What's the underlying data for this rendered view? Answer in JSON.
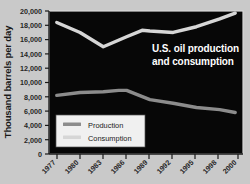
{
  "chart_data": {
    "type": "line",
    "title": "U.S. oil production and consumption",
    "title_line1": "U.S. oil production",
    "title_line2": "and consumption",
    "xlabel": "",
    "ylabel": "Thousand barrels per day",
    "x": [
      1977,
      1980,
      1983,
      1986,
      1989,
      1992,
      1995,
      1998,
      2000
    ],
    "categories": [
      "1977",
      "1980",
      "1983",
      "1986",
      "1989",
      "1992",
      "1995",
      "1998",
      "2000"
    ],
    "xlim": [
      1976,
      2001
    ],
    "ylim": [
      0,
      20000
    ],
    "yticks": [
      0,
      2000,
      4000,
      6000,
      8000,
      10000,
      12000,
      14000,
      16000,
      18000,
      20000
    ],
    "ytick_labels": [
      "0",
      "2,000",
      "4,000",
      "6,000",
      "8,000",
      "10,000",
      "12,000",
      "14,000",
      "16,000",
      "18,000",
      "20,000"
    ],
    "grid": false,
    "legend_position": "lower-left",
    "plot_background": "#050505",
    "figure_background": "#c9c9c9",
    "series": [
      {
        "name": "Production",
        "color": "#8c8c8c",
        "values": [
          8200,
          8600,
          8700,
          8900,
          7600,
          7100,
          6500,
          6200,
          5800
        ],
        "points": [
          {
            "x": 1977,
            "y": 8200
          },
          {
            "x": 1980,
            "y": 8600
          },
          {
            "x": 1983,
            "y": 8700
          },
          {
            "x": 1985,
            "y": 8900
          },
          {
            "x": 1986,
            "y": 8900
          },
          {
            "x": 1989,
            "y": 7600
          },
          {
            "x": 1992,
            "y": 7100
          },
          {
            "x": 1995,
            "y": 6500
          },
          {
            "x": 1998,
            "y": 6200
          },
          {
            "x": 2000,
            "y": 5800
          }
        ]
      },
      {
        "name": "Consumption",
        "color": "#d6d6d6",
        "values": [
          18400,
          17000,
          15000,
          16400,
          17300,
          17000,
          17800,
          18900,
          19700
        ],
        "points": [
          {
            "x": 1977,
            "y": 18400
          },
          {
            "x": 1980,
            "y": 17000
          },
          {
            "x": 1983,
            "y": 15000
          },
          {
            "x": 1986,
            "y": 16400
          },
          {
            "x": 1988,
            "y": 17300
          },
          {
            "x": 1989,
            "y": 17200
          },
          {
            "x": 1992,
            "y": 17000
          },
          {
            "x": 1995,
            "y": 17800
          },
          {
            "x": 1998,
            "y": 18900
          },
          {
            "x": 2000,
            "y": 19700
          }
        ]
      }
    ]
  },
  "legend": {
    "items": [
      {
        "label": "Production",
        "color": "#8c8c8c"
      },
      {
        "label": "Consumption",
        "color": "#d6d6d6"
      }
    ]
  }
}
